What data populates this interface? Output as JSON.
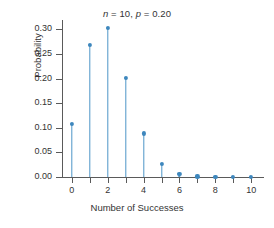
{
  "chart_data": {
    "type": "scatter",
    "plot_style": "stem",
    "title": "n = 10, p = 0.20",
    "title_parts": {
      "n_symbol": "n",
      "n_value": "= 10,",
      "p_symbol": "p",
      "p_value": "= 0.20"
    },
    "xlabel": "Number of Successes",
    "ylabel": "Probability",
    "x": [
      0,
      1,
      2,
      3,
      4,
      5,
      6,
      7,
      8,
      9,
      10
    ],
    "values": [
      0.1074,
      0.2684,
      0.302,
      0.2013,
      0.0881,
      0.0264,
      0.0055,
      0.0008,
      0.0001,
      0.0,
      0.0
    ],
    "xlim": [
      -0.55,
      10.6
    ],
    "ylim": [
      0.0,
      0.315
    ],
    "xticks": [
      0,
      1,
      2,
      3,
      4,
      5,
      6,
      7,
      8,
      9,
      10
    ],
    "xtick_labels": [
      "0",
      "",
      "2",
      "",
      "4",
      "",
      "6",
      "",
      "8",
      "",
      "10"
    ],
    "yticks": [
      0.0,
      0.05,
      0.1,
      0.15,
      0.2,
      0.25,
      0.3
    ],
    "ytick_labels": [
      "0.00",
      "0.05",
      "0.10",
      "0.15",
      "0.20",
      "0.25",
      "0.30"
    ],
    "grid": false,
    "legend": false,
    "series_color": "#4e96c8",
    "marker_color": "#3e87bd",
    "axis_color": "#5a5a5a",
    "background_color": "#ffffff"
  }
}
